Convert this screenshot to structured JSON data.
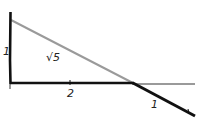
{
  "diagram": {
    "colors": {
      "ink": "#111111",
      "gray": "#9a9a9a",
      "background": "#ffffff"
    },
    "labels": {
      "vertical_leg": "1",
      "hypotenuse": "√5",
      "horizontal_leg": "2",
      "extension": "1"
    }
  }
}
